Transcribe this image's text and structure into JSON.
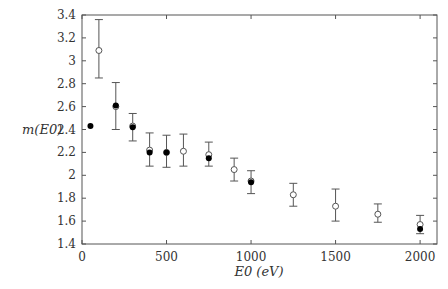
{
  "chart_data": {
    "type": "scatter",
    "title": "",
    "xlabel": "E0 (eV)",
    "ylabel": "m(E0)",
    "xlim": [
      0,
      2100
    ],
    "ylim": [
      1.4,
      3.4
    ],
    "xticks": [
      0,
      500,
      1000,
      1500,
      2000
    ],
    "xtick_labels": [
      "0",
      "500",
      "1000",
      "1500",
      "2000"
    ],
    "yticks": [
      1.4,
      1.6,
      1.8,
      2.0,
      2.2,
      2.4,
      2.6,
      2.8,
      3.0,
      3.2,
      3.4
    ],
    "ytick_labels": [
      "1.4",
      "1.6",
      "1.8",
      "2",
      "2.2",
      "2.4",
      "2.6",
      "2.8",
      "3",
      "3.2",
      "3.4"
    ],
    "grid": false,
    "legend": null,
    "series": [
      {
        "name": "open-circles-with-errors",
        "marker": "open-circle",
        "points": [
          {
            "x": 100,
            "y": 3.09,
            "ylo": 2.85,
            "yhi": 3.36
          },
          {
            "x": 200,
            "y": 2.6,
            "ylo": 2.4,
            "yhi": 2.81
          },
          {
            "x": 300,
            "y": 2.43,
            "ylo": 2.3,
            "yhi": 2.54
          },
          {
            "x": 400,
            "y": 2.22,
            "ylo": 2.08,
            "yhi": 2.37
          },
          {
            "x": 500,
            "y": 2.2,
            "ylo": 2.07,
            "yhi": 2.35
          },
          {
            "x": 600,
            "y": 2.21,
            "ylo": 2.08,
            "yhi": 2.36
          },
          {
            "x": 750,
            "y": 2.18,
            "ylo": 2.08,
            "yhi": 2.29
          },
          {
            "x": 900,
            "y": 2.05,
            "ylo": 1.95,
            "yhi": 2.15
          },
          {
            "x": 1000,
            "y": 1.95,
            "ylo": 1.84,
            "yhi": 2.04
          },
          {
            "x": 1250,
            "y": 1.83,
            "ylo": 1.73,
            "yhi": 1.93
          },
          {
            "x": 1500,
            "y": 1.73,
            "ylo": 1.6,
            "yhi": 1.88
          },
          {
            "x": 1750,
            "y": 1.66,
            "ylo": 1.59,
            "yhi": 1.75
          },
          {
            "x": 2000,
            "y": 1.57,
            "ylo": 1.49,
            "yhi": 1.65
          }
        ]
      },
      {
        "name": "filled-circles",
        "marker": "filled-circle",
        "points": [
          {
            "x": 50,
            "y": 2.43
          },
          {
            "x": 200,
            "y": 2.61
          },
          {
            "x": 300,
            "y": 2.42
          },
          {
            "x": 400,
            "y": 2.2
          },
          {
            "x": 500,
            "y": 2.2
          },
          {
            "x": 750,
            "y": 2.15
          },
          {
            "x": 1000,
            "y": 1.94
          },
          {
            "x": 2000,
            "y": 1.53
          }
        ]
      }
    ]
  }
}
